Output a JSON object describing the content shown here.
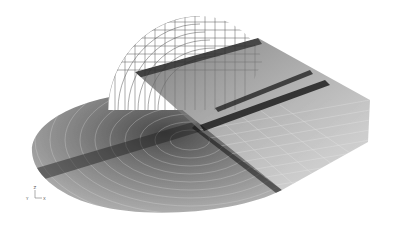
{
  "figure": {
    "background": "#ffffff",
    "mesh_color": "#2a2a2a",
    "dense_color": "#111111"
  },
  "axis_triad": {
    "z_label": "Z",
    "y_label": "Y",
    "x_label": "X"
  }
}
